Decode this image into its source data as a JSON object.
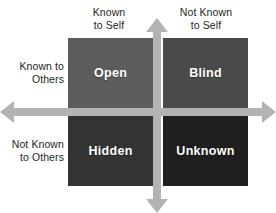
{
  "diagram": {
    "background_color": "#ffffff"
  },
  "axis_labels": {
    "top_left": "Known\nto Self",
    "top_right": "Not Known\nto Self",
    "left_top": "Known to\nOthers",
    "left_bottom": "Not Known\nto Others"
  },
  "quadrants": [
    {
      "id": "open",
      "label": "Open",
      "color": "#5c5c5c",
      "text_color": "#ffffff"
    },
    {
      "id": "blind",
      "label": "Blind",
      "color": "#4a4a4a",
      "text_color": "#ffffff"
    },
    {
      "id": "hidden",
      "label": "Hidden",
      "color": "#333333",
      "text_color": "#ffffff"
    },
    {
      "id": "unknown",
      "label": "Unknown",
      "color": "#1f1f1f",
      "text_color": "#ffffff"
    }
  ],
  "axes": {
    "vertical_arrow": "double-arrow-vertical",
    "horizontal_arrow": "double-arrow-horizontal",
    "color": "#b3b3b3"
  }
}
